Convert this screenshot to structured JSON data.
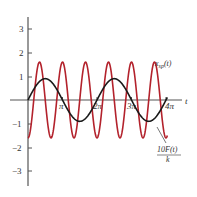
{
  "chart_data": {
    "type": "line",
    "title": "",
    "xlabel": "t",
    "ylabel": "",
    "xlim": [
      0,
      12.9
    ],
    "ylim": [
      -3.5,
      3.5
    ],
    "grid": false,
    "y_ticks": [
      -3,
      -2,
      -1,
      1,
      2,
      3
    ],
    "y_tick_labels": [
      "−3",
      "−2",
      "−1",
      "1",
      "2",
      "3"
    ],
    "x_ticks": [
      3.14159,
      6.28318,
      9.42478,
      12.56637
    ],
    "x_tick_labels": [
      "π",
      "2π",
      "3π",
      "4π"
    ],
    "series": [
      {
        "name": "x_sp(t)",
        "label": "x",
        "label_sub": "sp",
        "label_suffix": "(t)",
        "color": "#1a1a1a",
        "function": "0.9*sin(t)",
        "amplitude": 0.9,
        "omega": 1,
        "x": [
          0,
          0.785,
          1.571,
          2.356,
          3.142,
          3.927,
          4.712,
          5.498,
          6.283,
          7.069,
          7.854,
          8.639,
          9.425,
          10.21,
          10.996,
          11.781,
          12.566
        ],
        "values": [
          0,
          0.64,
          0.9,
          0.64,
          0,
          -0.64,
          -0.9,
          -0.64,
          0,
          0.64,
          0.9,
          0.64,
          0,
          -0.64,
          -0.9,
          -0.64,
          0
        ]
      },
      {
        "name": "10F(t)/k",
        "label_num": "10F(t)",
        "label_den": "k",
        "color": "#b3222c",
        "function": "-1.6*cos(3t)",
        "amplitude": 1.6,
        "omega": 3,
        "x": [
          0,
          0.524,
          1.047,
          1.571,
          2.094,
          2.618,
          3.142,
          3.665,
          4.189,
          4.712,
          5.236,
          5.76,
          6.283,
          6.807,
          7.33,
          7.854,
          8.378,
          8.901,
          9.425,
          9.948,
          10.472,
          10.996,
          11.519,
          12.043,
          12.566
        ],
        "values": [
          -1.6,
          0,
          1.6,
          0,
          -1.6,
          0,
          1.6,
          0,
          -1.6,
          0,
          1.6,
          0,
          -1.6,
          0,
          1.6,
          0,
          -1.6,
          0,
          1.6,
          0,
          -1.6,
          0,
          1.6,
          0,
          -1.6
        ]
      }
    ],
    "annotations": [
      {
        "text": "x_sp(t)",
        "target": "black curve",
        "position": "upper right"
      },
      {
        "text": "10F(t)/k",
        "target": "red curve",
        "position": "lower right with leader line"
      }
    ]
  },
  "labels": {
    "xaxis": "t",
    "y3": "3",
    "y2": "2",
    "y1": "1",
    "ym1": "−1",
    "ym2": "−2",
    "ym3": "−3",
    "pi1": "π",
    "pi2": "2π",
    "pi3": "3π",
    "pi4": "4π",
    "xsp_main": "x",
    "xsp_sub": "sp",
    "xsp_suffix": "(t)",
    "force_num": "10F(t)",
    "force_den": "k"
  }
}
